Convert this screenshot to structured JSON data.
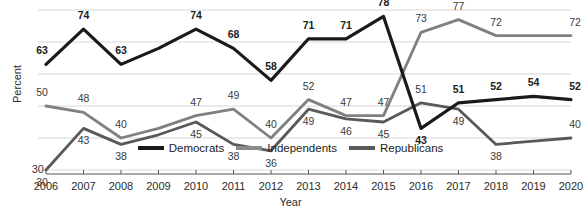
{
  "chart_data": {
    "type": "line",
    "title": "",
    "xlabel": "Year",
    "ylabel": "Percent",
    "categories": [
      2006,
      2007,
      2008,
      2009,
      2010,
      2011,
      2012,
      2013,
      2014,
      2015,
      2016,
      2017,
      2018,
      2019,
      2020
    ],
    "x": [
      "2006",
      "2007",
      "2008",
      "2009",
      "2010",
      "2011",
      "2012",
      "2013",
      "2014",
      "2015",
      "2016",
      "2017",
      "2018",
      "2019",
      "2020"
    ],
    "ylim": [
      30,
      80
    ],
    "yticks": [
      "30"
    ],
    "grid": true,
    "legend_position": "bottom",
    "series": [
      {
        "name": "Democrats",
        "color": "#1a1a1a",
        "values": [
          63,
          74,
          63,
          68,
          74,
          68,
          58,
          71,
          71,
          78,
          43,
          51,
          52,
          53,
          52
        ],
        "labels": [
          "63",
          "74",
          "63",
          "",
          "74",
          "68",
          "58",
          "71",
          "71",
          "78",
          "43",
          "51",
          "52",
          "54",
          "52"
        ]
      },
      {
        "name": "Independents",
        "color": "#808080",
        "values": [
          50,
          48,
          40,
          43,
          47,
          49,
          40,
          52,
          47,
          47,
          73,
          77,
          72,
          72,
          72
        ],
        "labels": [
          "50",
          "48",
          "40",
          "",
          "47",
          "49",
          "40",
          "52",
          "47",
          "47",
          "73",
          "77",
          "72",
          "",
          "72"
        ]
      },
      {
        "name": "Republicans",
        "color": "#595959",
        "values": [
          30,
          43,
          38,
          41,
          45,
          38,
          36,
          49,
          46,
          45,
          51,
          49,
          38,
          39,
          40
        ],
        "labels": [
          "30",
          "43",
          "38",
          "",
          "45",
          "38",
          "36",
          "49",
          "46",
          "45",
          "51",
          "49",
          "38",
          "",
          "40"
        ]
      }
    ]
  },
  "legend": {
    "items": [
      {
        "label": "Democrats",
        "color": "#1a1a1a"
      },
      {
        "label": "Independents",
        "color": "#8a8a8a"
      },
      {
        "label": "Republicans",
        "color": "#595959"
      }
    ]
  },
  "axes": {
    "y_title": "Percent",
    "x_title": "Year",
    "y_tick_label": "30"
  }
}
